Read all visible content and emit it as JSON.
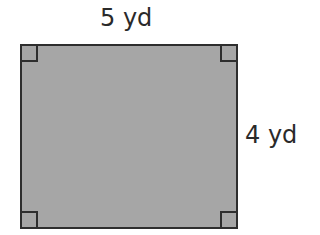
{
  "diagram": {
    "shape": "rectangle",
    "fill_color": "#a6a6a6",
    "stroke_color": "#2e2e2e",
    "width_label": "5 yd",
    "height_label": "4 yd",
    "right_angle_markers": [
      "top-left",
      "top-right",
      "bottom-left",
      "bottom-right"
    ]
  }
}
